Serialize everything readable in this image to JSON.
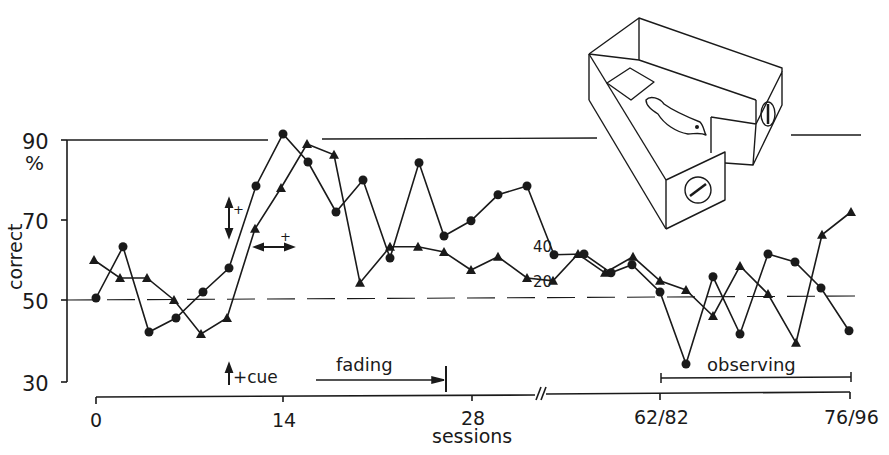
{
  "chart_data": {
    "type": "line",
    "title": "",
    "xlabel": "sessions",
    "ylabel": "correct",
    "y_unit": "%",
    "ylim": [
      30,
      90
    ],
    "y_ticks": [
      30,
      50,
      70,
      90
    ],
    "x_ticks": [
      {
        "label": "0",
        "px": 96
      },
      {
        "label": "14",
        "px": 283
      },
      {
        "label": "28",
        "px": 472
      },
      {
        "label": "62/82",
        "px": 660
      },
      {
        "label": "76/96",
        "px": 850
      }
    ],
    "axis_break_label": "//",
    "reference_lines": [
      {
        "y": 90,
        "style": "solid"
      },
      {
        "y": 50,
        "style": "dashed"
      }
    ],
    "grid": false,
    "legend": "inline labels",
    "series": [
      {
        "name": "40",
        "marker": "circle",
        "label_pos": {
          "x": 540,
          "y": 224
        },
        "points": [
          {
            "px": 96,
            "y": 50.5
          },
          {
            "px": 123,
            "y": 63.3
          },
          {
            "px": 149,
            "y": 42
          },
          {
            "px": 176,
            "y": 45.5
          },
          {
            "px": 203,
            "y": 52
          },
          {
            "px": 229,
            "y": 58
          },
          {
            "px": 256,
            "y": 78.5
          },
          {
            "px": 283,
            "y": 91.5
          },
          {
            "px": 308,
            "y": 84.5
          },
          {
            "px": 336,
            "y": 72
          },
          {
            "px": 363,
            "y": 80
          },
          {
            "px": 390,
            "y": 60.5
          },
          {
            "px": 419,
            "y": 84.3
          },
          {
            "px": 444,
            "y": 66
          },
          {
            "px": 471,
            "y": 69.8
          },
          {
            "px": 498,
            "y": 76.3
          },
          {
            "px": 527,
            "y": 78.5
          },
          {
            "px": 554,
            "y": 61.3
          },
          {
            "px": 584,
            "y": 61.5
          },
          {
            "px": 611,
            "y": 56.8
          },
          {
            "px": 632,
            "y": 58.8
          },
          {
            "px": 660,
            "y": 52
          },
          {
            "px": 686,
            "y": 34
          },
          {
            "px": 713,
            "y": 55.8
          },
          {
            "px": 740,
            "y": 41.5
          },
          {
            "px": 768,
            "y": 61.5
          },
          {
            "px": 795,
            "y": 59.5
          },
          {
            "px": 821,
            "y": 53
          },
          {
            "px": 849,
            "y": 42.3
          }
        ]
      },
      {
        "name": "20",
        "marker": "triangle",
        "label_pos": {
          "x": 531,
          "y": 282
        },
        "points": [
          {
            "px": 94,
            "y": 60
          },
          {
            "px": 120,
            "y": 55.5
          },
          {
            "px": 147,
            "y": 55.5
          },
          {
            "px": 174,
            "y": 50
          },
          {
            "px": 201,
            "y": 41.5
          },
          {
            "px": 227,
            "y": 45.5
          },
          {
            "px": 255,
            "y": 67.8
          },
          {
            "px": 281,
            "y": 78
          },
          {
            "px": 307,
            "y": 89
          },
          {
            "px": 334,
            "y": 86.3
          },
          {
            "px": 360,
            "y": 54.3
          },
          {
            "px": 390,
            "y": 63.3
          },
          {
            "px": 418,
            "y": 63.3
          },
          {
            "px": 444,
            "y": 62
          },
          {
            "px": 471,
            "y": 57.5
          },
          {
            "px": 498,
            "y": 60.8
          },
          {
            "px": 527,
            "y": 55.5
          },
          {
            "px": 553,
            "y": 54.8
          },
          {
            "px": 578,
            "y": 61.5
          },
          {
            "px": 605,
            "y": 56.8
          },
          {
            "px": 633,
            "y": 60.8
          },
          {
            "px": 660,
            "y": 54.8
          },
          {
            "px": 686,
            "y": 52.5
          },
          {
            "px": 713,
            "y": 46
          },
          {
            "px": 740,
            "y": 58.5
          },
          {
            "px": 768,
            "y": 51.5
          },
          {
            "px": 796,
            "y": 39.3
          },
          {
            "px": 822,
            "y": 66.3
          },
          {
            "px": 851,
            "y": 72
          }
        ]
      }
    ],
    "annotations": [
      {
        "text": "+cue",
        "type": "vertical-arrow",
        "x": 232,
        "y": 377
      },
      {
        "text": "fading",
        "type": "arrow-bracket",
        "x1": 316,
        "x2": 446,
        "y": 380
      },
      {
        "text": "observing",
        "type": "bracket",
        "x1": 661,
        "x2": 851,
        "y": 377
      },
      {
        "text": "+",
        "type": "vertical-double-arrow",
        "x": 230,
        "y": 215
      },
      {
        "text": "+",
        "type": "horizontal-double-arrow",
        "x": 245,
        "y": 247
      }
    ],
    "inset_illustration": "pigeon in a three-sided chamber with two round keys"
  },
  "labels": {
    "y90": "90",
    "y70": "70",
    "y50": "50",
    "y30": "30",
    "pct": "%",
    "ylabel": "correct",
    "xlabel": "sessions",
    "x0": "0",
    "x14": "14",
    "x28": "28",
    "x62": "62/82",
    "x76": "76/96",
    "series40": "40",
    "series20": "20",
    "cue": "+cue",
    "fading": "fading",
    "observing": "observing",
    "plus1": "+",
    "plus2": "+"
  }
}
